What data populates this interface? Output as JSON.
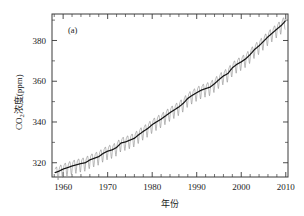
{
  "figure": {
    "panel_label": "(a)",
    "faint_header_text": "",
    "frame": {
      "left": 52,
      "top": 14,
      "right": 288,
      "bottom": 177
    }
  },
  "chart_data": {
    "type": "line",
    "title": "",
    "subtitle": "",
    "panel": "(a)",
    "xlabel": "年份",
    "ylabel": "CO₂浓度(ppm)",
    "ylabel_parts": {
      "prefix": "CO",
      "subscript": "2",
      "suffix": "浓度(ppm)"
    },
    "xlim": [
      1957.5,
      2010.5
    ],
    "ylim": [
      313,
      393
    ],
    "xticks": [
      1960,
      1970,
      1980,
      1990,
      2000,
      2010
    ],
    "xticklabels": [
      "1960",
      "1970",
      "1980",
      "1990",
      "2000",
      "2010"
    ],
    "xminor_step": 2,
    "yticks": [
      320,
      340,
      360,
      380
    ],
    "yticklabels": [
      "320",
      "340",
      "360",
      "380"
    ],
    "yminor_step": 10,
    "grid": false,
    "legend": null,
    "tick_direction": "in",
    "series": [
      {
        "name": "monthly-mean-co2",
        "color": "#8c8c8c",
        "style": "sawtooth-seasonal",
        "seasonal_amplitude_ppm": 3.2,
        "description": "月平均CO2浓度（含季节振荡）"
      },
      {
        "name": "smoothed-trend",
        "color": "#141414",
        "style": "solid",
        "description": "去除季节波动的平滑趋势线"
      }
    ],
    "x": [
      1958,
      1959,
      1960,
      1961,
      1962,
      1963,
      1964,
      1965,
      1966,
      1967,
      1968,
      1969,
      1970,
      1971,
      1972,
      1973,
      1974,
      1975,
      1976,
      1977,
      1978,
      1979,
      1980,
      1981,
      1982,
      1983,
      1984,
      1985,
      1986,
      1987,
      1988,
      1989,
      1990,
      1991,
      1992,
      1993,
      1994,
      1995,
      1996,
      1997,
      1998,
      1999,
      2000,
      2001,
      2002,
      2003,
      2004,
      2005,
      2006,
      2007,
      2008,
      2009,
      2010
    ],
    "trend_values": [
      315.0,
      315.8,
      316.9,
      317.6,
      318.4,
      319.0,
      319.6,
      320.0,
      321.4,
      322.2,
      323.0,
      324.6,
      325.7,
      326.3,
      327.5,
      329.7,
      330.2,
      331.1,
      332.0,
      333.8,
      335.4,
      336.8,
      338.7,
      340.1,
      341.4,
      343.0,
      344.6,
      346.0,
      347.4,
      349.2,
      351.6,
      353.1,
      354.4,
      355.6,
      356.4,
      357.1,
      358.8,
      360.8,
      362.6,
      363.8,
      366.6,
      368.3,
      369.5,
      371.0,
      373.1,
      375.6,
      377.4,
      379.6,
      381.8,
      383.7,
      385.6,
      387.4,
      389.8
    ],
    "units": "ppm",
    "data_source_label": ""
  }
}
